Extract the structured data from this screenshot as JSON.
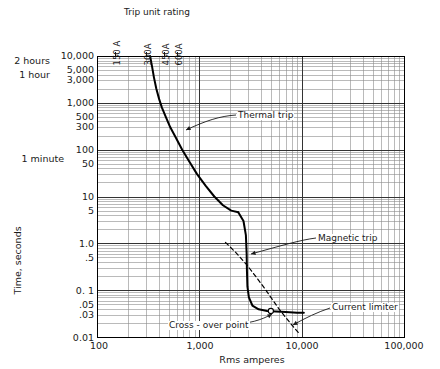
{
  "chart_data": {
    "type": "line",
    "title": "",
    "xlabel": "Rms amperes",
    "ylabel": "Time, seconds",
    "xscale": "log",
    "yscale": "log",
    "xlim": [
      100,
      100000
    ],
    "ylim": [
      0.01,
      10000
    ],
    "grid": true,
    "legend_position": "inline-annotations",
    "x_tick_labels": [
      "100",
      "1,000",
      "10,000",
      "100,000"
    ],
    "x_tick_values": [
      100,
      1000,
      10000,
      100000
    ],
    "y_tick_labels": [
      "10,000",
      "5,000",
      "3,000",
      "1,000",
      "500",
      "300",
      "100",
      "50",
      "10",
      "5",
      "1.0",
      ".5",
      "0. 1",
      ".05",
      ".03",
      "0.01"
    ],
    "y_tick_values": [
      10000,
      5000,
      3000,
      1000,
      500,
      300,
      100,
      50,
      10,
      5,
      1.0,
      0.5,
      0.1,
      0.05,
      0.03,
      0.01
    ],
    "time_equivalents": [
      {
        "label": "2 hours",
        "value": 7200
      },
      {
        "label": "1 hour",
        "value": 3600
      },
      {
        "label": "1 minute",
        "value": 60
      }
    ],
    "top_axis_title": "Trip unit rating",
    "trip_unit_ratings": [
      {
        "label": "150 A",
        "value": 150
      },
      {
        "label": "300A",
        "value": 300
      },
      {
        "label": "450A",
        "value": 450
      },
      {
        "label": "600A",
        "value": 600
      }
    ],
    "series": [
      {
        "name": "Thermal trip",
        "style": "solid",
        "points": [
          [
            330,
            10000
          ],
          [
            345,
            6000
          ],
          [
            360,
            3500
          ],
          [
            380,
            2000
          ],
          [
            405,
            1200
          ],
          [
            430,
            800
          ],
          [
            470,
            500
          ],
          [
            520,
            300
          ],
          [
            590,
            180
          ],
          [
            680,
            100
          ],
          [
            800,
            55
          ],
          [
            950,
            30
          ],
          [
            1150,
            17
          ],
          [
            1400,
            10
          ],
          [
            1700,
            6.5
          ],
          [
            2050,
            5.0
          ],
          [
            2400,
            4.6
          ]
        ]
      },
      {
        "name": "Magnetic trip",
        "style": "solid",
        "points": [
          [
            2400,
            4.6
          ],
          [
            2700,
            3.0
          ],
          [
            2850,
            1.5
          ],
          [
            2900,
            0.6
          ],
          [
            2920,
            0.25
          ],
          [
            2950,
            0.12
          ],
          [
            3050,
            0.07
          ],
          [
            3300,
            0.047
          ],
          [
            3800,
            0.039
          ],
          [
            4600,
            0.036
          ],
          [
            5600,
            0.035
          ],
          [
            7000,
            0.034
          ],
          [
            9000,
            0.033
          ],
          [
            10500,
            0.033
          ]
        ]
      },
      {
        "name": "Current limiter",
        "style": "dashed",
        "points": [
          [
            1800,
            1.05
          ],
          [
            2300,
            0.62
          ],
          [
            2900,
            0.35
          ],
          [
            3600,
            0.19
          ],
          [
            4400,
            0.105
          ],
          [
            5200,
            0.062
          ],
          [
            6000,
            0.04
          ],
          [
            7000,
            0.026
          ],
          [
            8200,
            0.017
          ],
          [
            9400,
            0.012
          ]
        ]
      }
    ],
    "annotations": [
      {
        "name": "Thermal trip",
        "text": "Thermal trip"
      },
      {
        "name": "Magnetic trip",
        "text": "Magnetic trip"
      },
      {
        "name": "Current limiter",
        "text": "Current limiter"
      },
      {
        "name": "Cross-over point",
        "text": "Cross - over point",
        "x": 5000,
        "y": 0.036
      }
    ]
  },
  "chart": {
    "top_title": "Trip unit rating",
    "x_title": "Rms amperes",
    "y_title": "Time, seconds",
    "ratings": {
      "r150": "150 A",
      "r300": "300A",
      "r450": "450A",
      "r600": "600A"
    },
    "hours": {
      "two_hours": "2 hours",
      "one_hour": "1 hour",
      "one_minute": "1 minute"
    },
    "yticks": {
      "t10000": "10,000",
      "t5000": "5,000",
      "t3000": "3,000",
      "t1000": "1,000",
      "t500": "500",
      "t300": "300",
      "t100": "100",
      "t50": "50",
      "t10": "10",
      "t5": "5",
      "t1": "1.0",
      "t05": ".5",
      "t01": "0. 1",
      "t005": ".05",
      "t003": ".03",
      "t001": "0.01"
    },
    "xticks": {
      "x100": "100",
      "x1000": "1,000",
      "x10000": "10,000",
      "x100000": "100,000"
    },
    "annotations": {
      "thermal": "Thermal trip",
      "magnetic": "Magnetic trip",
      "limiter": "Current limiter",
      "crossover": "Cross - over point"
    },
    "colors": {
      "curve": "#000000",
      "grid_minor": "#8c8c8c",
      "grid_major": "#333333",
      "frame": "#000000",
      "text": "#1a1a1a"
    }
  }
}
